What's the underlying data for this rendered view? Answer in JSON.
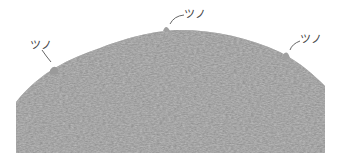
{
  "diagram": {
    "fill_color": "#9a9a9a",
    "label_color": "#444444",
    "labels": [
      {
        "text": "ツノ",
        "position": "left"
      },
      {
        "text": "ツノ",
        "position": "top"
      },
      {
        "text": "ツノ",
        "position": "right"
      }
    ]
  }
}
